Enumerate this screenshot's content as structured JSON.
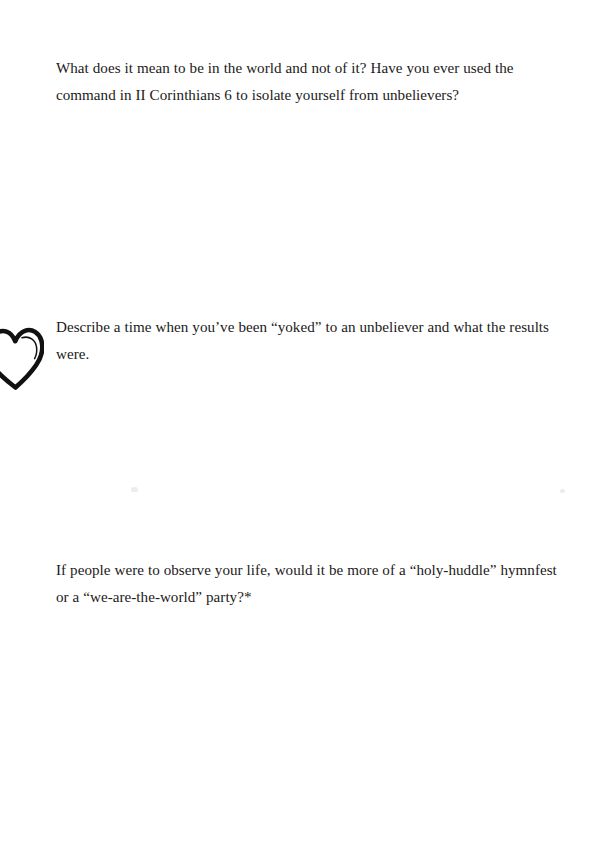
{
  "page": {
    "background_color": "#ffffff",
    "text_color": "#1c1a19",
    "width": 600,
    "height": 845
  },
  "content": {
    "questions": [
      {
        "id": "question-1",
        "text": "What does it mean to be in the world and not of it? Have you ever used the command in II Corinthians 6 to isolate yourself from unbelievers?"
      },
      {
        "id": "question-2",
        "text": "Describe a time when you’ve been “yoked” to an unbeliever and what the results were."
      },
      {
        "id": "question-3",
        "text": "If people were to observe your life, would it be more of a “holy-huddle” hymnfest or a “we-are-the-world” party?*"
      }
    ]
  },
  "decorations": {
    "heart": {
      "name": "heart-doodle",
      "stroke_color": "#111111",
      "description": "hand-drawn heart outline clipped at the left page margin"
    },
    "specks": [
      {
        "name": "scan-speck-left",
        "color": "#ededed"
      },
      {
        "name": "scan-speck-right",
        "color": "#ededed"
      }
    ]
  }
}
